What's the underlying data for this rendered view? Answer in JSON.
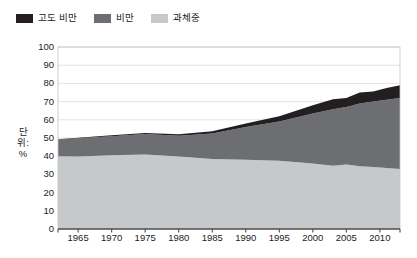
{
  "legend": {
    "items": [
      {
        "label": "고도 비만",
        "color": "#231f20",
        "name": "legend-item-severe-obesity"
      },
      {
        "label": "비만",
        "color": "#6d6e71",
        "name": "legend-item-obesity"
      },
      {
        "label": "과체중",
        "color": "#c7c8ca",
        "name": "legend-item-overweight"
      }
    ]
  },
  "axes": {
    "y_title": "단위: %",
    "y_ticks": [
      0,
      10,
      20,
      30,
      40,
      50,
      60,
      70,
      80,
      90,
      100
    ],
    "x_ticks": [
      1965,
      1970,
      1975,
      1980,
      1985,
      1990,
      1995,
      2000,
      2005,
      2010
    ]
  },
  "chart_data": {
    "type": "area",
    "title": "",
    "subtitle": "",
    "xlabel": "",
    "ylabel": "단위: %",
    "xlim": [
      1962,
      2013
    ],
    "ylim": [
      0,
      100
    ],
    "grid": true,
    "stacked": true,
    "legend_position": "top-left",
    "x": [
      1962,
      1965,
      1970,
      1975,
      1980,
      1985,
      1990,
      1995,
      2000,
      2003,
      2005,
      2007,
      2009,
      2011,
      2013
    ],
    "series": [
      {
        "name": "과체중",
        "color": "#c7c8ca",
        "values": [
          40.0,
          39.8,
          40.5,
          41.0,
          39.8,
          38.5,
          38.0,
          37.5,
          36.0,
          34.8,
          35.5,
          34.5,
          34.0,
          33.5,
          33.0
        ]
      },
      {
        "name": "비만",
        "color": "#6d6e71",
        "values": [
          9.0,
          10.0,
          10.5,
          11.2,
          11.5,
          14.0,
          18.0,
          21.5,
          27.5,
          31.0,
          31.5,
          34.5,
          36.0,
          37.5,
          39.0
        ]
      },
      {
        "name": "고도 비만",
        "color": "#231f20",
        "values": [
          0.3,
          0.4,
          0.5,
          0.6,
          0.8,
          1.2,
          2.0,
          3.0,
          4.5,
          5.5,
          5.0,
          6.0,
          5.5,
          6.5,
          7.0
        ]
      }
    ],
    "totals": [
      49.3,
      50.2,
      51.5,
      52.8,
      52.1,
      53.7,
      58.0,
      62.0,
      68.0,
      71.3,
      72.0,
      75.0,
      75.5,
      77.5,
      79.0
    ]
  }
}
